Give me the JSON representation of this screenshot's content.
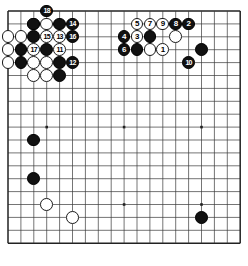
{
  "board": {
    "size": 19,
    "origin_x": 8,
    "origin_y": 11,
    "spacing": 12.9,
    "line_color": "#3a3a3a",
    "border_color": "#222222",
    "background": "#ffffff",
    "stone_radius": 6.4,
    "star_points": [
      [
        4,
        4
      ],
      [
        10,
        4
      ],
      [
        16,
        4
      ],
      [
        4,
        10
      ],
      [
        10,
        10
      ],
      [
        16,
        10
      ],
      [
        4,
        16
      ],
      [
        10,
        16
      ],
      [
        16,
        16
      ]
    ]
  },
  "chart_data": {
    "type": "table",
    "title": "",
    "stones": [
      {
        "color": "white",
        "col": 3,
        "row": 2,
        "label": ""
      },
      {
        "color": "black",
        "col": 4,
        "row": 1,
        "label": "18"
      },
      {
        "color": "black",
        "col": 3,
        "row": 2,
        "label": ""
      },
      {
        "color": "white",
        "col": 4,
        "row": 2,
        "label": ""
      },
      {
        "color": "black",
        "col": 5,
        "row": 2,
        "label": ""
      },
      {
        "color": "black",
        "col": 6,
        "row": 2,
        "label": "14"
      },
      {
        "color": "white",
        "col": 1,
        "row": 3,
        "label": ""
      },
      {
        "color": "white",
        "col": 2,
        "row": 3,
        "label": ""
      },
      {
        "color": "black",
        "col": 3,
        "row": 3,
        "label": ""
      },
      {
        "color": "white",
        "col": 4,
        "row": 3,
        "label": "15"
      },
      {
        "color": "white",
        "col": 5,
        "row": 3,
        "label": "13"
      },
      {
        "color": "black",
        "col": 6,
        "row": 3,
        "label": "16"
      },
      {
        "color": "white",
        "col": 1,
        "row": 4,
        "label": ""
      },
      {
        "color": "black",
        "col": 2,
        "row": 4,
        "label": ""
      },
      {
        "color": "white",
        "col": 3,
        "row": 4,
        "label": "17"
      },
      {
        "color": "black",
        "col": 4,
        "row": 4,
        "label": ""
      },
      {
        "color": "white",
        "col": 5,
        "row": 4,
        "label": "11"
      },
      {
        "color": "white",
        "col": 1,
        "row": 5,
        "label": ""
      },
      {
        "color": "black",
        "col": 2,
        "row": 5,
        "label": ""
      },
      {
        "color": "white",
        "col": 3,
        "row": 5,
        "label": ""
      },
      {
        "color": "white",
        "col": 4,
        "row": 5,
        "label": ""
      },
      {
        "color": "black",
        "col": 5,
        "row": 5,
        "label": ""
      },
      {
        "color": "black",
        "col": 6,
        "row": 5,
        "label": "12"
      },
      {
        "color": "white",
        "col": 3,
        "row": 6,
        "label": ""
      },
      {
        "color": "white",
        "col": 4,
        "row": 6,
        "label": ""
      },
      {
        "color": "black",
        "col": 5,
        "row": 6,
        "label": ""
      },
      {
        "color": "white",
        "col": 11,
        "row": 2,
        "label": "5"
      },
      {
        "color": "white",
        "col": 12,
        "row": 2,
        "label": "7"
      },
      {
        "color": "white",
        "col": 13,
        "row": 2,
        "label": "9"
      },
      {
        "color": "black",
        "col": 14,
        "row": 2,
        "label": "8"
      },
      {
        "color": "black",
        "col": 15,
        "row": 2,
        "label": "2"
      },
      {
        "color": "black",
        "col": 10,
        "row": 3,
        "label": "4"
      },
      {
        "color": "white",
        "col": 11,
        "row": 3,
        "label": "3"
      },
      {
        "color": "black",
        "col": 12,
        "row": 3,
        "label": ""
      },
      {
        "color": "white",
        "col": 14,
        "row": 3,
        "label": ""
      },
      {
        "color": "black",
        "col": 10,
        "row": 4,
        "label": "6"
      },
      {
        "color": "black",
        "col": 11,
        "row": 4,
        "label": ""
      },
      {
        "color": "white",
        "col": 12,
        "row": 4,
        "label": ""
      },
      {
        "color": "white",
        "col": 13,
        "row": 4,
        "label": "1"
      },
      {
        "color": "black",
        "col": 16,
        "row": 4,
        "label": ""
      },
      {
        "color": "black",
        "col": 15,
        "row": 5,
        "label": "10"
      },
      {
        "color": "black",
        "col": 3,
        "row": 11,
        "label": ""
      },
      {
        "color": "black",
        "col": 3,
        "row": 14,
        "label": ""
      },
      {
        "color": "white",
        "col": 4,
        "row": 16,
        "label": ""
      },
      {
        "color": "white",
        "col": 6,
        "row": 17,
        "label": ""
      },
      {
        "color": "black",
        "col": 16,
        "row": 17,
        "label": ""
      }
    ]
  }
}
